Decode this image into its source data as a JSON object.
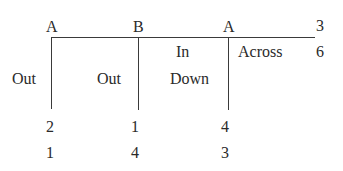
{
  "diagram": {
    "top_labels": [
      "A",
      "B",
      "A",
      "3"
    ],
    "right_label": "6",
    "columns": [
      {
        "header": "",
        "label": "Out"
      },
      {
        "header": "",
        "label": "Out"
      },
      {
        "header": "In",
        "label": "Down"
      },
      {
        "header": "Across",
        "label": ""
      }
    ],
    "values": [
      [
        "2",
        "1",
        "4"
      ],
      [
        "1",
        "4",
        "3"
      ]
    ]
  }
}
